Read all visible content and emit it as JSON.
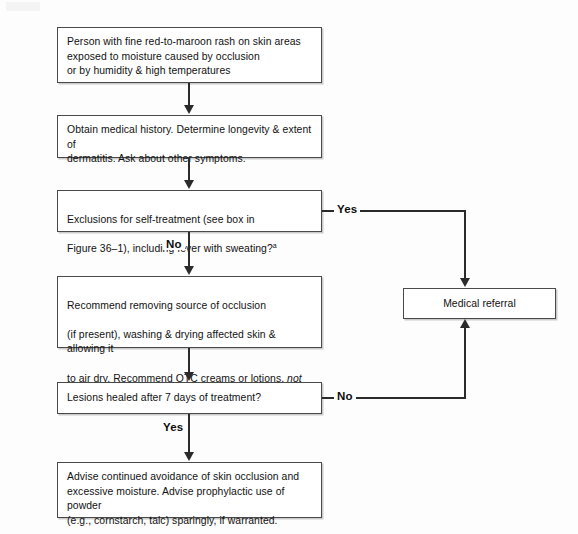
{
  "figure": {
    "type": "flowchart",
    "line_color": "#2b2b2b",
    "box_border_color": "#4a4a4a",
    "background_color": "#ffffff"
  },
  "nodes": {
    "assessment": {
      "id": "box-assessment",
      "text": "Person with fine red-to-maroon rash on skin areas\nexposed to moisture caused by occlusion\nor by humidity & high temperatures"
    },
    "history": {
      "id": "box-history",
      "text": "Obtain medical history. Determine longevity & extent of\ndermatitis. Ask about other symptoms."
    },
    "exclusions": {
      "id": "box-exclusions",
      "text_line1": "Exclusions for self-treatment (see box in",
      "text_line2_pre": "Figure 36–1), including fever with sweating?",
      "footnote_marker": "a"
    },
    "recommend": {
      "id": "box-recommend",
      "line1": "Recommend removing source of occlusion",
      "line2": "(if present), washing & drying affected skin & allowing it",
      "line3_pre": "to air dry. Recommend OTC creams or lotions, ",
      "line3_italic": "not",
      "line4_italic": "ointments",
      "line4_post": ", for itching/burning."
    },
    "healed": {
      "id": "box-healed",
      "text": "Lesions healed after 7 days of treatment?"
    },
    "advise": {
      "id": "box-advise",
      "text": "Advise continued avoidance of skin occlusion and\nexcessive moisture. Advise prophylactic use of powder\n(e.g., cornstarch, talc) sparingly, if warranted."
    },
    "referral": {
      "id": "box-referral",
      "text": "Medical referral"
    }
  },
  "branch_labels": {
    "exclusions_yes": "Yes",
    "exclusions_no": "No",
    "healed_no": "No",
    "healed_yes": "Yes"
  }
}
